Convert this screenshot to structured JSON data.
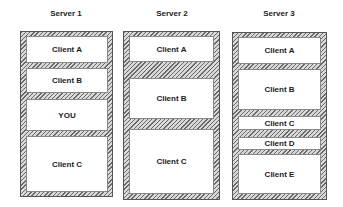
{
  "servers": [
    {
      "title": "Server 1",
      "clients": [
        {
          "label": "Client A"
        },
        {
          "label": "Client B"
        },
        {
          "label": "YOU"
        },
        {
          "label": "Client C"
        }
      ]
    },
    {
      "title": "Server 2",
      "clients": [
        {
          "label": "Client A"
        },
        {
          "label": "Client B"
        },
        {
          "label": "Client C"
        }
      ]
    },
    {
      "title": "Server 3",
      "clients": [
        {
          "label": "Client A"
        },
        {
          "label": "Client B"
        },
        {
          "label": "Client C"
        },
        {
          "label": "Client D"
        },
        {
          "label": "Client E"
        }
      ]
    }
  ]
}
